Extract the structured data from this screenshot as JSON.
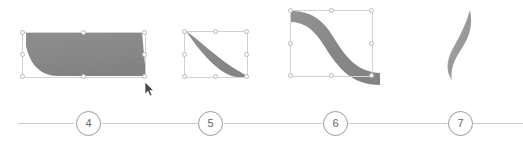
{
  "canvas": {
    "width": 523,
    "height": 142,
    "background": "#ffffff"
  },
  "style": {
    "shape_fill": "#8a8a8a",
    "shape_fill_light": "#9d9d9d",
    "selection_border": "#d2d2d2",
    "handle_border": "#b9b9b9",
    "handle_fill": "#ffffff",
    "rail_line": "#c9c9c9",
    "circle_border": "#9a9a9a",
    "circle_text": "#666666"
  },
  "shapes": [
    {
      "id": "shape-4",
      "name": "parallelogram-skewed-band",
      "selected": true,
      "box": {
        "x": 22,
        "y": 32,
        "w": 124,
        "h": 46
      },
      "fill": "#8a8a8a"
    },
    {
      "id": "shape-5",
      "name": "diagonal-curved-band",
      "selected": true,
      "box": {
        "x": 184,
        "y": 31,
        "w": 64,
        "h": 47
      },
      "fill": "#8a8a8a"
    },
    {
      "id": "shape-6",
      "name": "s-curve-wave-band",
      "selected": true,
      "box": {
        "x": 290,
        "y": 10,
        "w": 83,
        "h": 67
      },
      "fill": "#8a8a8a"
    },
    {
      "id": "shape-7",
      "name": "narrow-flame-curve",
      "selected": false,
      "box": null,
      "fill": "#9d9d9d"
    }
  ],
  "cursor": {
    "name": "mouse-pointer",
    "x": 144,
    "y": 82,
    "visible": true
  },
  "captions": [
    {
      "number": "4",
      "center_x": 88,
      "line_left_x": 18,
      "line_right_x": 158
    },
    {
      "number": "5",
      "center_x": 210,
      "line_left_x": 143,
      "line_right_x": 282
    },
    {
      "number": "6",
      "center_x": 335,
      "line_left_x": 267,
      "line_right_x": 406
    },
    {
      "number": "7",
      "center_x": 460,
      "line_left_x": 392,
      "line_right_x": 523
    }
  ]
}
